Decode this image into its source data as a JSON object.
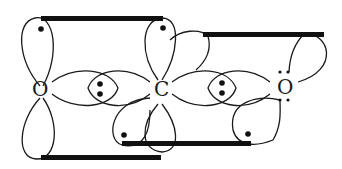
{
  "diagram": {
    "atoms": [
      {
        "symbol": "O",
        "position": "left",
        "lone_pair_dots": 0
      },
      {
        "symbol": "C",
        "position": "center",
        "lone_pair_dots": 0
      },
      {
        "symbol": "O",
        "position": "right",
        "lone_pair_dots": 4
      }
    ],
    "sigma_bonds": [
      {
        "between": [
          "O-left",
          "C"
        ],
        "electrons": 2
      },
      {
        "between": [
          "C",
          "O-right"
        ],
        "electrons": 2
      }
    ],
    "pi_bonds": [
      {
        "plane": "vertical",
        "between": [
          "O-left",
          "C"
        ],
        "bars": [
          "top",
          "bottom"
        ]
      },
      {
        "plane": "offset",
        "between": [
          "C",
          "O-right"
        ],
        "bars": [
          "top",
          "bottom"
        ]
      }
    ],
    "colors": {
      "line": "#1a1a1a",
      "background": "#ffffff"
    }
  }
}
